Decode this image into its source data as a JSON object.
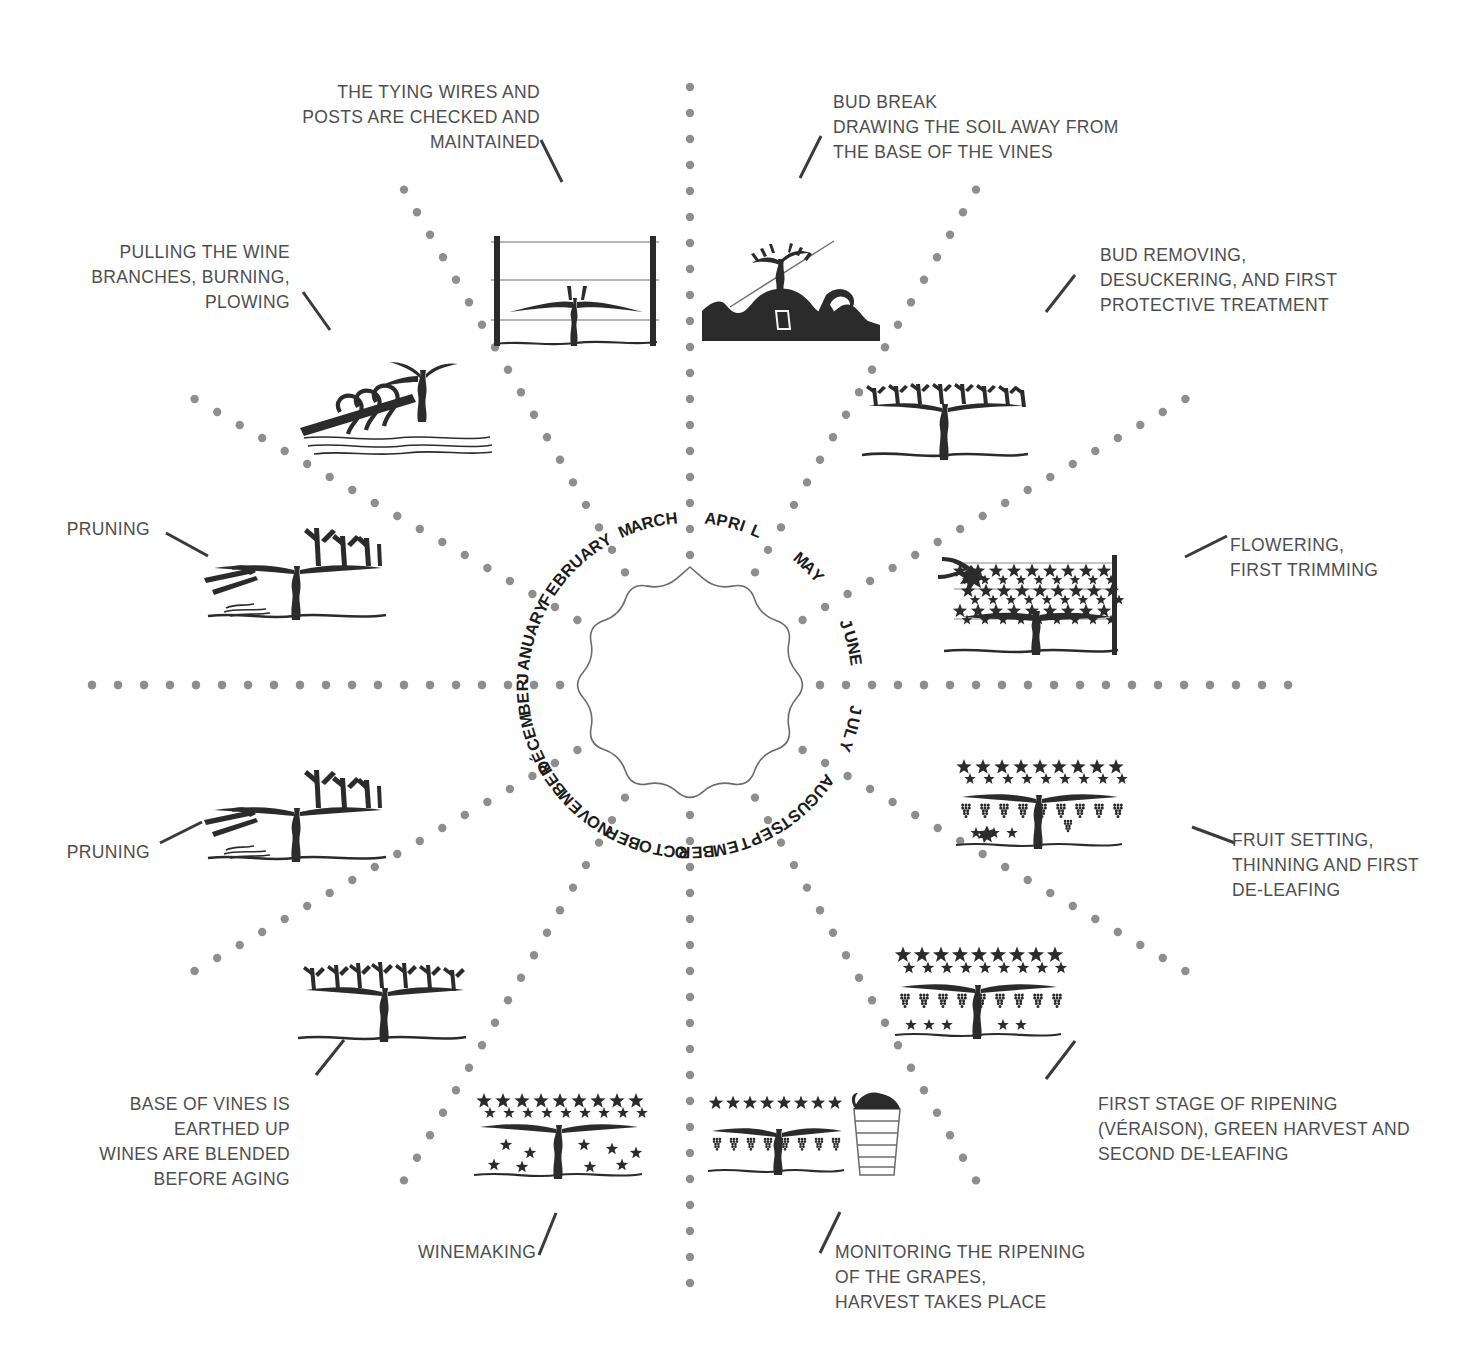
{
  "diagram": {
    "center_shape": "scalloped-rosette",
    "colors": {
      "background": "#ffffff",
      "label_text": "#4e4e4e",
      "month_text": "#1c1c1c",
      "dotted_ray": "#8e8e8e",
      "leader_line": "#3a3a3a",
      "illustration_ink": "#2b2b2b"
    }
  },
  "months": [
    {
      "name": "JANUARY",
      "angle_deg": 195
    },
    {
      "name": "FEBRUARY",
      "angle_deg": 225
    },
    {
      "name": "MARCH",
      "angle_deg": 255
    },
    {
      "name": "APRIL",
      "angle_deg": 285
    },
    {
      "name": "MAY",
      "angle_deg": 315
    },
    {
      "name": "JUNE",
      "angle_deg": 345
    },
    {
      "name": "JULY",
      "angle_deg": 15
    },
    {
      "name": "AUGUST",
      "angle_deg": 45
    },
    {
      "name": "SEPTEMBER",
      "angle_deg": 75
    },
    {
      "name": "OCTOBER",
      "angle_deg": 105
    },
    {
      "name": "NOVEMBER",
      "angle_deg": 135
    },
    {
      "name": "DÉCEMBER",
      "angle_deg": 165
    }
  ],
  "tasks": [
    {
      "id": "january",
      "month": "JANUARY",
      "text": "PRUNING",
      "align": "right",
      "icon": "pruning-vine-illustration"
    },
    {
      "id": "february",
      "month": "FEBRUARY",
      "text": "PULLING THE WINE\nBRANCHES, BURNING,\nPLOWING",
      "align": "right",
      "icon": "plowing-vine-illustration"
    },
    {
      "id": "march",
      "month": "MARCH",
      "text": "THE TYING WIRES AND\nPOSTS ARE CHECKED AND\nMAINTAINED",
      "align": "right",
      "icon": "trellis-posts-illustration"
    },
    {
      "id": "april",
      "month": "APRIL",
      "text": "BUD BREAK\nDRAWING THE SOIL AWAY FROM\nTHE BASE OF THE VINES",
      "align": "left",
      "icon": "bud-break-soil-illustration"
    },
    {
      "id": "may",
      "month": "MAY",
      "text": "BUD REMOVING,\nDESUCKERING, AND FIRST\nPROTECTIVE TREATMENT",
      "align": "left",
      "icon": "bud-removing-illustration"
    },
    {
      "id": "june",
      "month": "JUNE",
      "text": "FLOWERING,\nFIRST TRIMMING",
      "align": "left",
      "icon": "flowering-trimming-illustration"
    },
    {
      "id": "july",
      "month": "JULY",
      "text": "FRUIT SETTING,\nTHINNING AND FIRST\nDE-LEAFING",
      "align": "left",
      "icon": "fruit-setting-illustration"
    },
    {
      "id": "august",
      "month": "AUGUST",
      "text": "FIRST STAGE OF RIPENING\n(VÉRAISON), GREEN HARVEST AND\nSECOND DE-LEAFING",
      "align": "left",
      "icon": "veraison-illustration"
    },
    {
      "id": "september",
      "month": "SEPTEMBER",
      "text": "MONITORING THE RIPENING\nOF THE GRAPES,\nHARVEST TAKES PLACE",
      "align": "left",
      "icon": "harvest-basket-illustration"
    },
    {
      "id": "october",
      "month": "OCTOBER",
      "text": "WINEMAKING",
      "align": "left",
      "icon": "winemaking-vine-illustration"
    },
    {
      "id": "november",
      "month": "NOVEMBER",
      "text": "BASE OF VINES IS\nEARTHED UP\nWINES ARE BLENDED\nBEFORE AGING",
      "align": "right",
      "icon": "earthing-up-illustration"
    },
    {
      "id": "december",
      "month": "DÉCEMBER",
      "text": "PRUNING",
      "align": "right",
      "icon": "pruning-vine-illustration-2"
    }
  ]
}
